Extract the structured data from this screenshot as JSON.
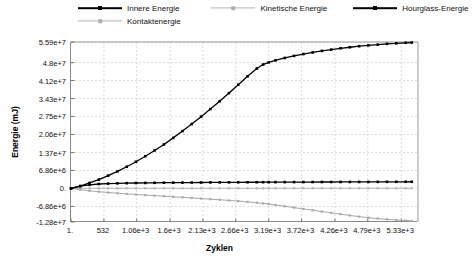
{
  "chart_data": {
    "type": "line",
    "title": "",
    "xlabel": "Zyklen",
    "ylabel": "Energie (mJ)",
    "grid": true,
    "legend_position": "top",
    "xlim": [
      1,
      5600
    ],
    "ylim": [
      -12800000,
      55900000
    ],
    "x_tick_labels": [
      "1.",
      "532",
      "1.06e+3",
      "1.6e+3",
      "2.13e+3",
      "2.66e+3",
      "3.19e+3",
      "3.72e+3",
      "4.26e+3",
      "4.79e+3",
      "5.33e+3"
    ],
    "x_tick_values": [
      1,
      532,
      1060,
      1600,
      2130,
      2660,
      3190,
      3720,
      4260,
      4790,
      5330
    ],
    "y_tick_labels": [
      "5.59e+7",
      "4.8e+7",
      "4.12e+7",
      "3.43e+7",
      "2.75e+7",
      "2.06e+7",
      "1.37e+7",
      "6.86e+6",
      "0.",
      "-6.86e+6",
      "-1.28e+7"
    ],
    "y_tick_values": [
      55900000,
      48000000,
      41200000,
      34300000,
      27500000,
      20600000,
      13700000,
      6860000,
      0,
      -6860000,
      -12800000
    ],
    "x": [
      1,
      150,
      300,
      450,
      600,
      750,
      900,
      1050,
      1200,
      1350,
      1500,
      1650,
      1800,
      1950,
      2100,
      2250,
      2400,
      2550,
      2700,
      2850,
      3000,
      3100,
      3190,
      3300,
      3450,
      3600,
      3750,
      3900,
      4050,
      4200,
      4350,
      4500,
      4650,
      4800,
      4950,
      5100,
      5250,
      5400,
      5500
    ],
    "series": [
      {
        "name": "Innere Energie",
        "color": "#000000",
        "style": "dark",
        "values": [
          0,
          900000,
          2100000,
          3400000,
          4900000,
          6500000,
          8300000,
          10200000,
          12300000,
          14500000,
          16800000,
          19300000,
          21900000,
          24600000,
          27400000,
          30300000,
          33300000,
          36400000,
          39600000,
          42800000,
          45800000,
          47300000,
          48100000,
          48900000,
          49800000,
          50600000,
          51300000,
          51900000,
          52500000,
          53000000,
          53500000,
          53900000,
          54300000,
          54600000,
          54900000,
          55200000,
          55400000,
          55600000,
          55700000
        ]
      },
      {
        "name": "Kinetische Energie",
        "color": "#b4b4b4",
        "style": "light",
        "values": [
          0,
          40000,
          50000,
          55000,
          58000,
          60000,
          62000,
          63000,
          64000,
          65000,
          66000,
          66000,
          67000,
          67000,
          68000,
          68000,
          69000,
          69000,
          70000,
          70000,
          71000,
          71000,
          71000,
          71000,
          72000,
          72000,
          72000,
          72000,
          73000,
          73000,
          73000,
          73000,
          73000,
          74000,
          74000,
          74000,
          74000,
          74000,
          74000
        ]
      },
      {
        "name": "Hourglass-Energie",
        "color": "#000000",
        "style": "dark",
        "values": [
          0,
          900000,
          1400000,
          1700000,
          1850000,
          1950000,
          2020000,
          2080000,
          2120000,
          2160000,
          2190000,
          2220000,
          2240000,
          2260000,
          2280000,
          2300000,
          2320000,
          2340000,
          2350000,
          2370000,
          2380000,
          2390000,
          2400000,
          2410000,
          2420000,
          2430000,
          2440000,
          2450000,
          2460000,
          2470000,
          2480000,
          2490000,
          2500000,
          2510000,
          2520000,
          2530000,
          2540000,
          2550000,
          2560000
        ]
      },
      {
        "name": "Kontaktenergie",
        "color": "#a8a8a8",
        "style": "light",
        "values": [
          0,
          -500000,
          -900000,
          -1250000,
          -1550000,
          -1820000,
          -2060000,
          -2300000,
          -2520000,
          -2740000,
          -2960000,
          -3180000,
          -3400000,
          -3620000,
          -3850000,
          -4080000,
          -4320000,
          -4570000,
          -4820000,
          -5120000,
          -5450000,
          -5700000,
          -5950000,
          -6300000,
          -6800000,
          -7300000,
          -7800000,
          -8300000,
          -8800000,
          -9300000,
          -9800000,
          -10300000,
          -10750000,
          -11150000,
          -11500000,
          -11800000,
          -12050000,
          -12250000,
          -12400000
        ]
      }
    ]
  },
  "legend": {
    "items": [
      {
        "label": "Innere Energie",
        "style": "dark"
      },
      {
        "label": "Kinetische Energie",
        "style": "light"
      },
      {
        "label": "Hourglass-Energie",
        "style": "dark"
      },
      {
        "label": "Kontaktenergie",
        "style": "light"
      }
    ]
  }
}
